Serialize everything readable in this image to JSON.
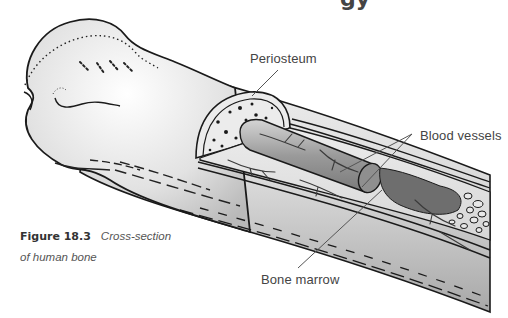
{
  "page": {
    "heading_fragment": "gy"
  },
  "diagram": {
    "labels": [
      {
        "id": "periosteum",
        "text": "Periosteum"
      },
      {
        "id": "blood-vessels",
        "text": "Blood vessels"
      },
      {
        "id": "bone-marrow",
        "text": "Bone marrow"
      }
    ],
    "colors": {
      "outline": "#1a1a1a",
      "bone_light": "#f2f2f2",
      "bone_mid": "#c9c9c9",
      "bone_dark": "#8a8a8a",
      "marrow_dark": "#6e6e6e",
      "leader_line": "#555555"
    }
  },
  "caption": {
    "number": "Figure 18.3",
    "title_line1": "Cross-section",
    "title_line2": "of human bone"
  }
}
